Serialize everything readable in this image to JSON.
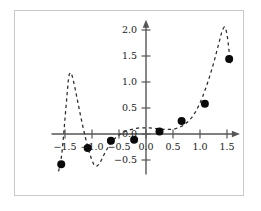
{
  "figure": {
    "frame_color": "#c9c9c9",
    "background": "#ffffff",
    "axis_color": "#555555",
    "curve_color": "#2b2b2b",
    "point_color": "#0a0a0a"
  },
  "chart_data": {
    "type": "scatter",
    "title": "",
    "subtitle": "",
    "xlabel": "",
    "ylabel": "",
    "grid": false,
    "legend": false,
    "legend_position": "none",
    "xlim": [
      -1.75,
      1.72
    ],
    "ylim": [
      -0.78,
      2.18
    ],
    "xticks": [
      -1.5,
      -1.0,
      -0.5,
      0.0,
      0.5,
      1.0,
      1.5
    ],
    "yticks": [
      -0.5,
      0.0,
      0.5,
      1.0,
      1.5,
      2.0
    ],
    "xtick_labels": [
      "−1.5",
      "−1.0",
      "−0.5",
      "0.0",
      "0.5",
      "1.0",
      "1.5"
    ],
    "ytick_labels": [
      "−0.5",
      "0.0",
      "0.5",
      "1.0",
      "1.5",
      "2.0"
    ],
    "axis_style": "arrow-tipped-cross",
    "series": [
      {
        "name": "data-points",
        "type": "scatter",
        "marker": "filled-circle",
        "marker_size": 4,
        "color": "#0a0a0a",
        "points": [
          {
            "x": -1.57,
            "y": -0.58
          },
          {
            "x": -1.08,
            "y": -0.27
          },
          {
            "x": -0.65,
            "y": -0.13
          },
          {
            "x": -0.22,
            "y": -0.11
          },
          {
            "x": 0.25,
            "y": 0.05
          },
          {
            "x": 0.66,
            "y": 0.25
          },
          {
            "x": 1.09,
            "y": 0.58
          },
          {
            "x": 1.54,
            "y": 1.44
          }
        ]
      },
      {
        "name": "fitted-curve",
        "type": "line",
        "style": "dashed",
        "color": "#2b2b2b",
        "points": [
          {
            "x": -1.62,
            "y": -0.72
          },
          {
            "x": -1.58,
            "y": -0.55
          },
          {
            "x": -1.55,
            "y": -0.3
          },
          {
            "x": -1.52,
            "y": 0.05
          },
          {
            "x": -1.49,
            "y": 0.42
          },
          {
            "x": -1.46,
            "y": 0.78
          },
          {
            "x": -1.44,
            "y": 1.02
          },
          {
            "x": -1.42,
            "y": 1.15
          },
          {
            "x": -1.4,
            "y": 1.18
          },
          {
            "x": -1.38,
            "y": 1.16
          },
          {
            "x": -1.35,
            "y": 1.05
          },
          {
            "x": -1.31,
            "y": 0.86
          },
          {
            "x": -1.26,
            "y": 0.6
          },
          {
            "x": -1.21,
            "y": 0.34
          },
          {
            "x": -1.16,
            "y": 0.1
          },
          {
            "x": -1.11,
            "y": -0.12
          },
          {
            "x": -1.06,
            "y": -0.32
          },
          {
            "x": -1.01,
            "y": -0.48
          },
          {
            "x": -0.97,
            "y": -0.58
          },
          {
            "x": -0.94,
            "y": -0.62
          },
          {
            "x": -0.91,
            "y": -0.62
          },
          {
            "x": -0.87,
            "y": -0.58
          },
          {
            "x": -0.82,
            "y": -0.49
          },
          {
            "x": -0.77,
            "y": -0.38
          },
          {
            "x": -0.71,
            "y": -0.27
          },
          {
            "x": -0.65,
            "y": -0.17
          },
          {
            "x": -0.58,
            "y": -0.09
          },
          {
            "x": -0.5,
            "y": -0.02
          },
          {
            "x": -0.42,
            "y": 0.03
          },
          {
            "x": -0.34,
            "y": 0.07
          },
          {
            "x": -0.26,
            "y": 0.09
          },
          {
            "x": -0.18,
            "y": 0.11
          },
          {
            "x": -0.1,
            "y": 0.12
          },
          {
            "x": -0.02,
            "y": 0.12
          },
          {
            "x": 0.06,
            "y": 0.12
          },
          {
            "x": 0.14,
            "y": 0.11
          },
          {
            "x": 0.22,
            "y": 0.1
          },
          {
            "x": 0.3,
            "y": 0.09
          },
          {
            "x": 0.38,
            "y": 0.09
          },
          {
            "x": 0.46,
            "y": 0.09
          },
          {
            "x": 0.54,
            "y": 0.1
          },
          {
            "x": 0.62,
            "y": 0.13
          },
          {
            "x": 0.7,
            "y": 0.17
          },
          {
            "x": 0.78,
            "y": 0.24
          },
          {
            "x": 0.85,
            "y": 0.32
          },
          {
            "x": 0.92,
            "y": 0.43
          },
          {
            "x": 0.99,
            "y": 0.57
          },
          {
            "x": 1.05,
            "y": 0.72
          },
          {
            "x": 1.11,
            "y": 0.89
          },
          {
            "x": 1.17,
            "y": 1.08
          },
          {
            "x": 1.23,
            "y": 1.28
          },
          {
            "x": 1.28,
            "y": 1.47
          },
          {
            "x": 1.33,
            "y": 1.67
          },
          {
            "x": 1.37,
            "y": 1.83
          },
          {
            "x": 1.4,
            "y": 1.95
          },
          {
            "x": 1.43,
            "y": 2.03
          },
          {
            "x": 1.45,
            "y": 2.06
          },
          {
            "x": 1.47,
            "y": 2.04
          },
          {
            "x": 1.49,
            "y": 1.97
          },
          {
            "x": 1.51,
            "y": 1.85
          },
          {
            "x": 1.53,
            "y": 1.68
          },
          {
            "x": 1.55,
            "y": 1.49
          },
          {
            "x": 1.56,
            "y": 1.36
          }
        ]
      }
    ]
  }
}
